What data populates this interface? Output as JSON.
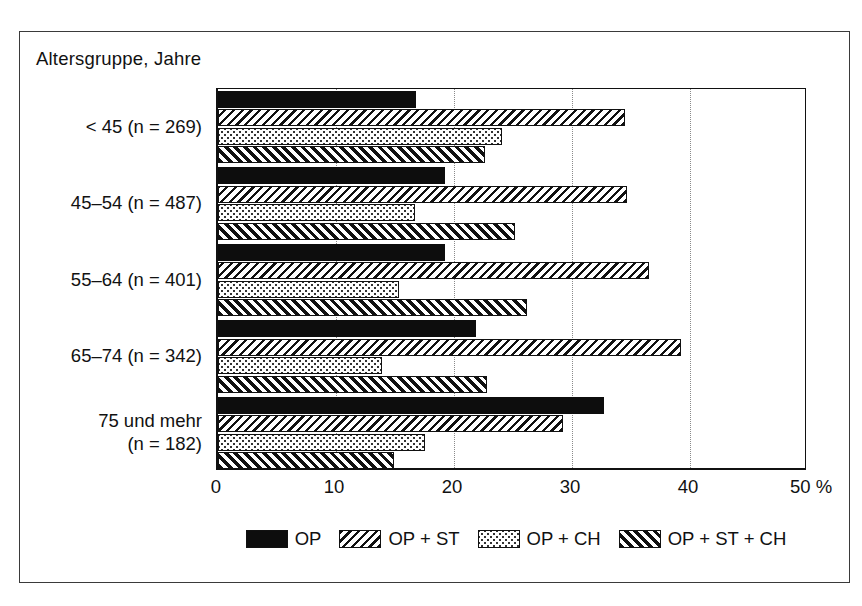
{
  "chart_data": {
    "type": "bar",
    "orientation": "horizontal",
    "title": "",
    "axis_caption": "Altersgruppe, Jahre",
    "xlabel": "%",
    "ylabel": "Altersgruppe, Jahre",
    "xlim": [
      0,
      50
    ],
    "xticks": [
      0,
      10,
      20,
      30,
      40,
      50
    ],
    "xticklabels": [
      "0",
      "10",
      "20",
      "30",
      "40",
      "50 %"
    ],
    "grid": "vertical-dotted",
    "legend_position": "bottom",
    "categories": [
      "< 45 (n = 269)",
      "45–54 (n = 487)",
      "55–64 (n = 401)",
      "65–74 (n = 342)",
      "75 und mehr\n(n = 182)"
    ],
    "series": [
      {
        "name": "OP",
        "pattern": "solid-black",
        "values": [
          16.8,
          19.2,
          19.2,
          21.9,
          32.7
        ]
      },
      {
        "name": "OP + ST",
        "pattern": "backslash-hatch",
        "values": [
          34.5,
          34.7,
          36.5,
          39.2,
          29.2
        ]
      },
      {
        "name": "OP + CH",
        "pattern": "dotted-stipple",
        "values": [
          24.1,
          16.7,
          15.3,
          13.9,
          17.5
        ]
      },
      {
        "name": "OP + ST + CH",
        "pattern": "forwardslash-hatch",
        "values": [
          22.6,
          25.2,
          26.2,
          22.8,
          14.9
        ]
      }
    ]
  },
  "legend": {
    "items": [
      {
        "label": "OP",
        "swatch": "solid-black-swatch"
      },
      {
        "label": "OP + ST",
        "swatch": "backslash-hatch-swatch"
      },
      {
        "label": "OP + CH",
        "swatch": "dotted-stipple-swatch"
      },
      {
        "label": "OP + ST + CH",
        "swatch": "forwardslash-hatch-swatch"
      }
    ]
  },
  "colors": {
    "ink": "#111111",
    "background": "#ffffff",
    "gridline": "#8a8a8a",
    "frame": "#3a3a3a"
  }
}
